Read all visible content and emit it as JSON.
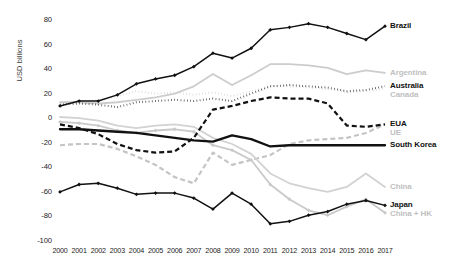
{
  "chart_data": {
    "type": "line",
    "title": "",
    "xlabel": "",
    "ylabel": "USD billions",
    "ylim": [
      -100,
      80
    ],
    "ytick_labels": [
      "80",
      "60",
      "40",
      "20",
      "0",
      "-20",
      "-40",
      "-60",
      "-80",
      "-100"
    ],
    "yticks": [
      80,
      60,
      40,
      20,
      0,
      -20,
      -40,
      -60,
      -80,
      -100
    ],
    "grid": false,
    "legend_position": "right-inline-end-of-line",
    "x": [
      2000,
      2001,
      2002,
      2003,
      2004,
      2005,
      2006,
      2007,
      2008,
      2009,
      2010,
      2011,
      2012,
      2013,
      2014,
      2015,
      2016,
      2017
    ],
    "categories": [
      "2000",
      "2001",
      "2002",
      "2003",
      "2004",
      "2005",
      "2006",
      "2007",
      "2008",
      "2009",
      "2010",
      "2011",
      "2012",
      "2013",
      "2014",
      "2015",
      "2016",
      "2017"
    ],
    "series": [
      {
        "name": "Brazil",
        "color": "#111111",
        "style": "solid-marker",
        "emphasis": "dark",
        "values": [
          10,
          14,
          14,
          19,
          28,
          32,
          35,
          42,
          53,
          49,
          57,
          72,
          74,
          77,
          74,
          69,
          64,
          75
        ]
      },
      {
        "name": "Argentina",
        "color": "#cccccc",
        "style": "solid",
        "emphasis": "light",
        "values": [
          13,
          13,
          12,
          13,
          15,
          17,
          20,
          26,
          36,
          27,
          35,
          44,
          44,
          43,
          41,
          36,
          39,
          37
        ]
      },
      {
        "name": "Australia",
        "color": "#1d1d1d",
        "style": "dotted",
        "emphasis": "dark",
        "values": [
          11,
          12,
          11,
          9,
          13,
          14,
          15,
          14,
          16,
          14,
          20,
          26,
          27,
          26,
          25,
          22,
          23,
          26
        ]
      },
      {
        "name": "Canada",
        "color": "#cfcfcf",
        "style": "dotted",
        "emphasis": "light",
        "values": [
          12,
          14,
          14,
          18,
          22,
          20,
          21,
          19,
          21,
          18,
          22,
          26,
          26,
          25,
          24,
          21,
          22,
          24
        ]
      },
      {
        "name": "EUA",
        "color": "#111111",
        "style": "dashed",
        "emphasis": "dark",
        "values": [
          -5,
          -8,
          -13,
          -21,
          -26,
          -28,
          -27,
          -16,
          7,
          10,
          14,
          17,
          16,
          16,
          12,
          -6,
          -7,
          -5
        ]
      },
      {
        "name": "UE",
        "color": "#c4c4c4",
        "style": "dashed",
        "emphasis": "light",
        "values": [
          -22,
          -21,
          -21,
          -25,
          -31,
          -38,
          -48,
          -53,
          -28,
          -38,
          -34,
          -30,
          -21,
          -18,
          -17,
          -16,
          -12,
          -5
        ]
      },
      {
        "name": "South Korea",
        "color": "#111111",
        "style": "solid-thick",
        "emphasis": "dark",
        "values": [
          -9,
          -9,
          -10,
          -11,
          -12,
          -14,
          -16,
          -18,
          -19,
          -14,
          -17,
          -23,
          -22,
          -22,
          -22,
          -22,
          -22,
          -22
        ]
      },
      {
        "name": "China",
        "color": "#d2d2d2",
        "style": "solid",
        "emphasis": "light",
        "values": [
          1,
          0,
          -2,
          -6,
          -8,
          -6,
          -5,
          -7,
          -16,
          -21,
          -29,
          -45,
          -53,
          -57,
          -60,
          -56,
          -45,
          -56
        ]
      },
      {
        "name": "Japan",
        "color": "#111111",
        "style": "solid-marker",
        "emphasis": "dark",
        "values": [
          -60,
          -54,
          -53,
          -57,
          -62,
          -61,
          -61,
          -65,
          -74,
          -61,
          -70,
          -86,
          -84,
          -79,
          -76,
          -70,
          -67,
          -71
        ]
      },
      {
        "name": "China + HK",
        "color": "#c9c9c9",
        "style": "solid-marker",
        "emphasis": "light",
        "values": [
          -3,
          -4,
          -6,
          -10,
          -12,
          -10,
          -9,
          -11,
          -22,
          -26,
          -34,
          -54,
          -66,
          -75,
          -79,
          -72,
          -66,
          -77
        ]
      }
    ],
    "series_labels": [
      {
        "name": "Brazil",
        "emphasis": "dark"
      },
      {
        "name": "Argentina",
        "emphasis": "light"
      },
      {
        "name": "Australia",
        "emphasis": "dark"
      },
      {
        "name": "Canada",
        "emphasis": "light"
      },
      {
        "name": "EUA",
        "emphasis": "dark"
      },
      {
        "name": "UE",
        "emphasis": "light"
      },
      {
        "name": "South Korea",
        "emphasis": "dark"
      },
      {
        "name": "China",
        "emphasis": "light"
      },
      {
        "name": "Japan",
        "emphasis": "dark"
      },
      {
        "name": "China + HK",
        "emphasis": "light"
      }
    ]
  }
}
